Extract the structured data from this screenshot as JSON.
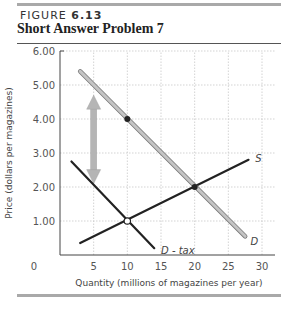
{
  "figure": {
    "label_prefix": "FIGURE",
    "label_number": "6.13",
    "title": "Short Answer Problem 7"
  },
  "chart_data": {
    "type": "line",
    "title": "Short Answer Problem 7",
    "xlabel": "Quantity (millions of magazines per year)",
    "ylabel": "Price (dollars per magazines)",
    "xlim": [
      0,
      30
    ],
    "ylim": [
      0,
      6
    ],
    "xticks": [
      0,
      5,
      10,
      15,
      20,
      25,
      30
    ],
    "xtick_labels": [
      "0",
      "5",
      "10",
      "15",
      "20",
      "25",
      "30"
    ],
    "yticks": [
      1,
      2,
      3,
      4,
      5,
      6
    ],
    "ytick_labels": [
      "1.00",
      "2.00",
      "3.00",
      "4.00",
      "5.00",
      "6.00"
    ],
    "grid": true,
    "series": [
      {
        "name": "S",
        "color": "#222222",
        "points": [
          [
            3,
            0.35
          ],
          [
            28,
            2.8
          ]
        ]
      },
      {
        "name": "D",
        "color": "#aaaaaa",
        "points": [
          [
            3,
            5.4
          ],
          [
            27.5,
            0.55
          ]
        ]
      },
      {
        "name": "D - tax",
        "color": "#222222",
        "points": [
          [
            1.7,
            2.75
          ],
          [
            14,
            0.2
          ]
        ]
      }
    ],
    "markers": [
      {
        "x": 10,
        "y": 4.0,
        "style": "filled"
      },
      {
        "x": 20,
        "y": 2.0,
        "style": "filled"
      },
      {
        "x": 10,
        "y": 1.0,
        "style": "open"
      }
    ],
    "annotations": [
      {
        "type": "double-arrow",
        "x": 5,
        "y_from": 4.7,
        "y_to": 2.1,
        "color": "#b5b5b5"
      }
    ],
    "curve_labels": [
      {
        "text": "S",
        "x": 29,
        "y": 2.85
      },
      {
        "text": "D",
        "x": 28.3,
        "y": 0.4
      },
      {
        "text": "D - tax",
        "x": 15,
        "y": 0.15
      }
    ]
  }
}
